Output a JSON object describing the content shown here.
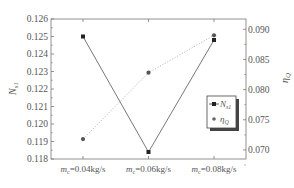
{
  "chart_data": {
    "type": "line",
    "title": "",
    "categories": [
      "m_c=0.04kg/s",
      "m_c=0.06kg/s",
      "m_c=0.08kg/s"
    ],
    "category_labels": [
      {
        "var": "m",
        "sub": "c",
        "rest": "=0.04kg/s"
      },
      {
        "var": "m",
        "sub": "c",
        "rest": "=0.06kg/s"
      },
      {
        "var": "m",
        "sub": "c",
        "rest": "=0.08kg/s"
      }
    ],
    "xlabel": "",
    "ylabel_left": "N_s1",
    "ylabel_right": "η_Q",
    "ylim_left": [
      0.118,
      0.126
    ],
    "ylim_right": [
      0.0685,
      0.0917
    ],
    "yticks_left": [
      "0.126",
      "0.125",
      "0.124",
      "0.123",
      "0.122",
      "0.121",
      "0.120",
      "0.119",
      "0.118"
    ],
    "yticks_right": [
      "0.090",
      "0.085",
      "0.080",
      "0.075",
      "0.070"
    ],
    "grid": false,
    "legend_position": "center-right inside plot",
    "series": [
      {
        "name": "N_s1",
        "axis": "left",
        "marker": "square",
        "line": "solid",
        "color": "#333333",
        "values": [
          0.125,
          0.1184,
          0.1248
        ]
      },
      {
        "name": "η_Q",
        "axis": "right",
        "marker": "circle",
        "line": "dotted",
        "color": "#666666",
        "values": [
          0.0718,
          0.0828,
          0.089
        ]
      }
    ]
  },
  "legend": {
    "items": [
      {
        "symbol": "N",
        "sub": "s1"
      },
      {
        "symbol": "η",
        "sub": "Q"
      }
    ]
  },
  "axes": {
    "left_title": {
      "symbol": "N",
      "sub": "s1"
    },
    "right_title": {
      "symbol": "η",
      "sub": "Q"
    }
  }
}
